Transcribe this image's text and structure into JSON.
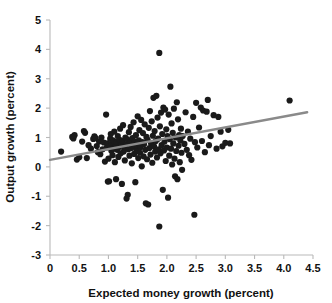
{
  "chart_data": {
    "type": "scatter",
    "title": "",
    "xlabel": "Expected money growth (percent)",
    "ylabel": "Output growth (percent)",
    "xlim": [
      0,
      4.5
    ],
    "ylim": [
      -3,
      5
    ],
    "xticks": [
      "0",
      "0.5",
      "1.0",
      "1.5",
      "2.0",
      "2.5",
      "3.0",
      "3.5",
      "4.0",
      "4.5"
    ],
    "xtick_values": [
      0,
      0.5,
      1.0,
      1.5,
      2.0,
      2.5,
      3.0,
      3.5,
      4.0,
      4.5
    ],
    "yticks": [
      "5",
      "4",
      "3",
      "2",
      "1",
      "0",
      "-1",
      "-2",
      "-3"
    ],
    "ytick_values": [
      5,
      4,
      3,
      2,
      1,
      0,
      -1,
      -2,
      -3
    ],
    "grid": false,
    "legend": null,
    "marker_color": "#1a1a1a",
    "marker_size": 3.1,
    "trendline": {
      "type": "line",
      "color": "#8a8a8a",
      "x": [
        0.0,
        4.4
      ],
      "y": [
        0.24,
        1.86
      ],
      "slope": 0.368,
      "intercept": 0.24
    },
    "series": [
      {
        "name": "countries",
        "n_points": 187,
        "points": [
          [
            0.19,
            0.52
          ],
          [
            0.38,
            1.02
          ],
          [
            0.4,
            0.97
          ],
          [
            0.42,
            1.08
          ],
          [
            0.46,
            0.25
          ],
          [
            0.5,
            0.33
          ],
          [
            0.55,
            0.86
          ],
          [
            0.58,
            1.22
          ],
          [
            0.6,
            1.16
          ],
          [
            0.63,
            0.3
          ],
          [
            0.66,
            0.74
          ],
          [
            0.7,
            0.62
          ],
          [
            0.74,
            0.95
          ],
          [
            0.76,
            1.04
          ],
          [
            0.78,
            0.98
          ],
          [
            0.8,
            0.71
          ],
          [
            0.82,
            0.5
          ],
          [
            0.84,
            0.86
          ],
          [
            0.86,
            0.43
          ],
          [
            0.88,
            1.0
          ],
          [
            0.9,
            0.6
          ],
          [
            0.92,
            0.83
          ],
          [
            0.94,
            0.18
          ],
          [
            0.96,
            1.78
          ],
          [
            0.97,
            0.66
          ],
          [
            0.98,
            0.8
          ],
          [
            0.99,
            -0.5
          ],
          [
            1.0,
            0.28
          ],
          [
            1.01,
            -0.49
          ],
          [
            1.02,
            0.72
          ],
          [
            1.03,
            0.96
          ],
          [
            1.04,
            1.12
          ],
          [
            1.05,
            0.55
          ],
          [
            1.06,
            0.78
          ],
          [
            1.07,
            0.4
          ],
          [
            1.08,
            0.9
          ],
          [
            1.09,
            0.62
          ],
          [
            1.1,
            1.2
          ],
          [
            1.11,
            0.16
          ],
          [
            1.12,
            0.7
          ],
          [
            1.13,
            -0.42
          ],
          [
            1.14,
            0.84
          ],
          [
            1.15,
            0.58
          ],
          [
            1.16,
            1.05
          ],
          [
            1.17,
            0.34
          ],
          [
            1.18,
            0.68
          ],
          [
            1.19,
            0.92
          ],
          [
            1.2,
            1.3
          ],
          [
            1.21,
            0.46
          ],
          [
            1.22,
            0.75
          ],
          [
            1.23,
            -0.58
          ],
          [
            1.24,
            0.88
          ],
          [
            1.25,
            1.42
          ],
          [
            1.26,
            0.52
          ],
          [
            1.27,
            0.66
          ],
          [
            1.28,
            0.22
          ],
          [
            1.29,
            1.0
          ],
          [
            1.3,
            0.76
          ],
          [
            1.31,
            -1.08
          ],
          [
            1.32,
            0.94
          ],
          [
            1.33,
            -0.95
          ],
          [
            1.34,
            0.6
          ],
          [
            1.35,
            1.18
          ],
          [
            1.36,
            0.38
          ],
          [
            1.37,
            0.82
          ],
          [
            1.38,
            1.36
          ],
          [
            1.39,
            0.64
          ],
          [
            1.4,
            0.12
          ],
          [
            1.41,
            0.98
          ],
          [
            1.42,
            0.7
          ],
          [
            1.43,
            1.52
          ],
          [
            1.44,
            0.44
          ],
          [
            1.45,
            0.86
          ],
          [
            1.46,
            -0.52
          ],
          [
            1.47,
            1.08
          ],
          [
            1.48,
            0.56
          ],
          [
            1.49,
            0.74
          ],
          [
            1.5,
            1.72
          ],
          [
            1.51,
            0.3
          ],
          [
            1.52,
            0.9
          ],
          [
            1.53,
            1.25
          ],
          [
            1.54,
            0.48
          ],
          [
            1.55,
            0.68
          ],
          [
            1.56,
            1.6
          ],
          [
            1.57,
            0.02
          ],
          [
            1.58,
            0.84
          ],
          [
            1.59,
            1.15
          ],
          [
            1.6,
            0.36
          ],
          [
            1.61,
            0.78
          ],
          [
            1.62,
            1.45
          ],
          [
            1.63,
            0.58
          ],
          [
            1.64,
            -1.24
          ],
          [
            1.65,
            1.02
          ],
          [
            1.66,
            0.26
          ],
          [
            1.67,
            0.92
          ],
          [
            1.68,
            -1.28
          ],
          [
            1.69,
            1.33
          ],
          [
            1.7,
            0.64
          ],
          [
            1.71,
            1.9
          ],
          [
            1.72,
            0.42
          ],
          [
            1.73,
            0.8
          ],
          [
            1.74,
            1.55
          ],
          [
            1.75,
            0.14
          ],
          [
            1.76,
            1.06
          ],
          [
            1.77,
            2.35
          ],
          [
            1.78,
            0.7
          ],
          [
            1.79,
            1.22
          ],
          [
            1.8,
            0.52
          ],
          [
            1.81,
            0.88
          ],
          [
            1.82,
            2.42
          ],
          [
            1.83,
            0.32
          ],
          [
            1.84,
            1.68
          ],
          [
            1.85,
            0.96
          ],
          [
            1.86,
            0.6
          ],
          [
            1.87,
            3.88
          ],
          [
            1.87,
            -2.03
          ],
          [
            1.88,
            1.38
          ],
          [
            1.89,
            0.46
          ],
          [
            1.9,
            1.85
          ],
          [
            1.91,
            0.74
          ],
          [
            1.92,
            1.12
          ],
          [
            1.93,
            -0.78
          ],
          [
            1.94,
            2.02
          ],
          [
            1.95,
            0.56
          ],
          [
            1.96,
            0.86
          ],
          [
            1.97,
            1.95
          ],
          [
            1.98,
            0.2
          ],
          [
            1.99,
            1.28
          ],
          [
            2.0,
            0.66
          ],
          [
            2.01,
            1.05
          ],
          [
            2.02,
            -1.05
          ],
          [
            2.03,
            1.78
          ],
          [
            2.04,
            0.38
          ],
          [
            2.05,
            0.94
          ],
          [
            2.06,
            2.73
          ],
          [
            2.07,
            0.62
          ],
          [
            2.08,
            1.48
          ],
          [
            2.09,
            0.08
          ],
          [
            2.1,
            1.16
          ],
          [
            2.11,
            0.8
          ],
          [
            2.12,
            1.98
          ],
          [
            2.13,
            0.28
          ],
          [
            2.14,
            -0.32
          ],
          [
            2.15,
            1.0
          ],
          [
            2.16,
            0.54
          ],
          [
            2.17,
            2.2
          ],
          [
            2.18,
            -0.42
          ],
          [
            2.19,
            1.62
          ],
          [
            2.2,
            0.72
          ],
          [
            2.21,
            1.08
          ],
          [
            2.22,
            0.16
          ],
          [
            2.23,
            0.9
          ],
          [
            2.24,
            1.3
          ],
          [
            2.25,
            0.48
          ],
          [
            2.26,
            -0.1
          ],
          [
            2.27,
            1.05
          ],
          [
            2.3,
            0.78
          ],
          [
            2.32,
            1.86
          ],
          [
            2.34,
            0.58
          ],
          [
            2.36,
            1.2
          ],
          [
            2.38,
            0.4
          ],
          [
            2.4,
            0.96
          ],
          [
            2.42,
            0.24
          ],
          [
            2.45,
            1.7
          ],
          [
            2.47,
            -1.63
          ],
          [
            2.48,
            0.84
          ],
          [
            2.5,
            2.18
          ],
          [
            2.52,
            0.66
          ],
          [
            2.55,
            1.34
          ],
          [
            2.58,
            2.02
          ],
          [
            2.6,
            0.88
          ],
          [
            2.62,
            1.92
          ],
          [
            2.65,
            0.5
          ],
          [
            2.68,
            1.88
          ],
          [
            2.7,
            2.28
          ],
          [
            2.72,
            0.74
          ],
          [
            2.75,
            1.05
          ],
          [
            2.8,
            1.76
          ],
          [
            2.85,
            0.62
          ],
          [
            2.88,
            1.7
          ],
          [
            2.92,
            1.2
          ],
          [
            2.95,
            0.7
          ],
          [
            3.0,
            0.82
          ],
          [
            3.05,
            1.26
          ],
          [
            3.08,
            0.8
          ],
          [
            4.1,
            2.26
          ]
        ]
      }
    ]
  },
  "axes": {
    "x_title": "Expected money growth (percent)",
    "y_title": "Output growth (percent)"
  }
}
